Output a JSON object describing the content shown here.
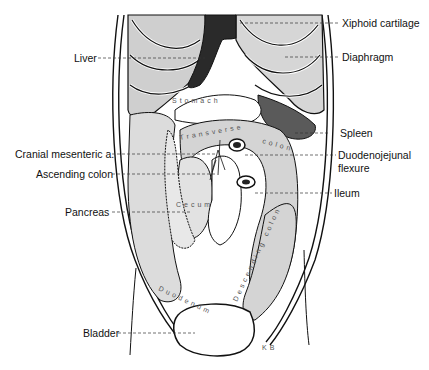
{
  "diagram": {
    "type": "anatomical-illustration",
    "colors": {
      "outline": "#111111",
      "rib_fill": "#c8c8c8",
      "rib_light": "#dcdcdc",
      "liver": "#2a2a2a",
      "spleen": "#5a5a5a",
      "stippled_organ": "#d9d9d9",
      "background": "#ffffff"
    },
    "labels_left": [
      {
        "id": "liver",
        "text": "Liver"
      },
      {
        "id": "cranial-mesenteric",
        "text": "Cranial mesenteric a."
      },
      {
        "id": "ascending-colon",
        "text": "Ascending colon"
      },
      {
        "id": "pancreas",
        "text": "Pancreas"
      },
      {
        "id": "bladder",
        "text": "Bladder"
      }
    ],
    "labels_right": [
      {
        "id": "xiphoid",
        "text": "Xiphoid cartilage"
      },
      {
        "id": "diaphragm",
        "text": "Diaphragm"
      },
      {
        "id": "spleen",
        "text": "Spleen"
      },
      {
        "id": "duodenojejunal-1",
        "text": "Duodenojejunal"
      },
      {
        "id": "duodenojejunal-2",
        "text": "flexure"
      },
      {
        "id": "ileum",
        "text": "Ileum"
      }
    ],
    "organ_text": {
      "stomach": "Stomach",
      "transverse_colon": "Transverse colon",
      "cecum": "Cecum",
      "duodenum": "Duodenum",
      "descending_colon": "Descending colon",
      "signature": "KB"
    }
  }
}
